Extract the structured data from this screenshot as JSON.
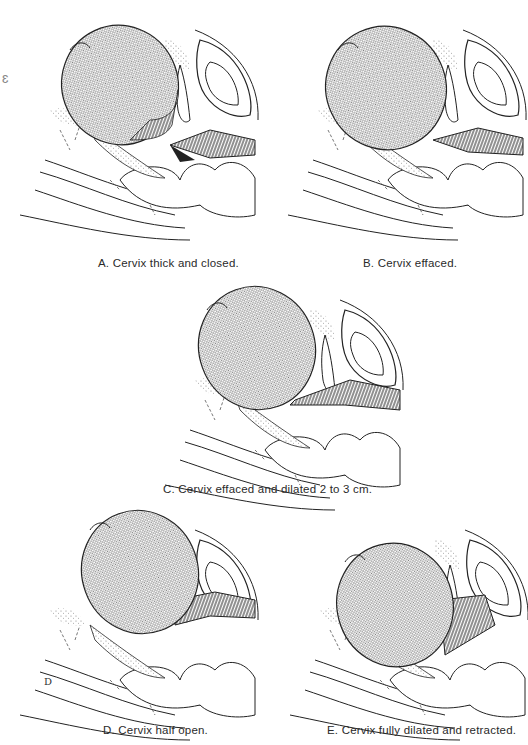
{
  "figure": {
    "panels": [
      {
        "id": "A",
        "caption": "A. Cervix thick and closed."
      },
      {
        "id": "B",
        "caption": "B. Cervix effaced."
      },
      {
        "id": "C",
        "caption": "C. Cervix effaced and dilated 2 to 3 cm."
      },
      {
        "id": "D",
        "caption": "D. Cervix half open."
      },
      {
        "id": "E",
        "caption": "E. Cervix fully dilated and retracted."
      }
    ],
    "artist_mark": "D",
    "colors": {
      "ink": "#222222",
      "stipple": "#9a9a9a",
      "paper": "#ffffff"
    }
  }
}
